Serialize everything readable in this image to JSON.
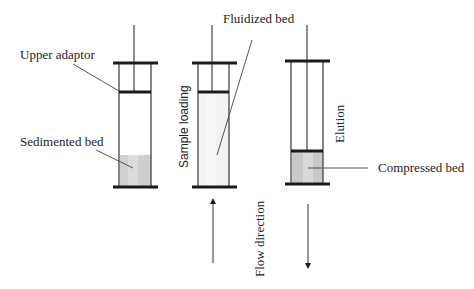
{
  "diagram": {
    "colors": {
      "stroke": "#1a1a1a",
      "wall": "#444444",
      "leader": "#555555",
      "bed_dense": "#cfcfcf",
      "bed_band": "#dedede",
      "bed_fluid": "#f0f0f0"
    },
    "columns": [
      {
        "id": "sedimented",
        "stage": "Settled",
        "bed_label": "Sedimented bed",
        "adaptor_label": "Upper adaptor"
      },
      {
        "id": "fluidized",
        "stage": "Sample loading",
        "bed_label": "Fluidized bed"
      },
      {
        "id": "compressed",
        "stage": "Elution",
        "bed_label": "Compressed bed"
      }
    ],
    "labels": {
      "upper_adaptor": "Upper adaptor",
      "sedimented_bed": "Sedimented bed",
      "fluidized_bed": "Fluidized bed",
      "compressed_bed": "Compressed bed",
      "sample_loading": "Sample loading",
      "elution": "Elution",
      "flow_direction": "Flow direction"
    },
    "arrows": [
      {
        "id": "upflow",
        "direction": "up",
        "stage": "Sample loading"
      },
      {
        "id": "downflow",
        "direction": "down",
        "stage": "Elution"
      }
    ]
  }
}
